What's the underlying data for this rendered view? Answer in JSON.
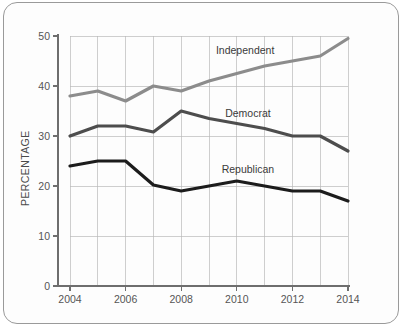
{
  "chart_data": {
    "type": "line",
    "title": "",
    "subtitle": "",
    "xlabel": "",
    "ylabel": "PERCENTAGE",
    "x": [
      2004,
      2005,
      2006,
      2007,
      2008,
      2009,
      2010,
      2011,
      2012,
      2013,
      2014
    ],
    "xlim": [
      2004,
      2014
    ],
    "ylim": [
      0,
      50
    ],
    "ytick_labels": [
      "0",
      "10",
      "20",
      "30",
      "40",
      "50"
    ],
    "ytick_values": [
      0,
      10,
      20,
      30,
      40,
      50
    ],
    "xtick_labels": [
      "2004",
      "2006",
      "2008",
      "2010",
      "2012",
      "2014"
    ],
    "xtick_values": [
      2004,
      2006,
      2008,
      2010,
      2012,
      2014
    ],
    "grid": true,
    "grid_x_every": 1,
    "legend_position": "inline-labels",
    "series": [
      {
        "name": "Independent",
        "color": "#8c8c8c",
        "values": [
          38,
          39,
          37,
          40,
          39,
          41,
          42.5,
          44,
          45,
          46,
          49.5
        ],
        "label_x": 2010.3,
        "label_y": 46.5
      },
      {
        "name": "Democrat",
        "color": "#4d4d4d",
        "values": [
          30,
          32,
          32,
          30.8,
          35,
          33.5,
          32.5,
          31.5,
          30,
          30,
          27
        ],
        "label_x": 2010.4,
        "label_y": 33.8
      },
      {
        "name": "Republican",
        "color": "#1c1c1c",
        "values": [
          24,
          25,
          25,
          20.2,
          19,
          20,
          21,
          20,
          19,
          19,
          17
        ],
        "label_x": 2010.4,
        "label_y": 22.6
      }
    ]
  }
}
